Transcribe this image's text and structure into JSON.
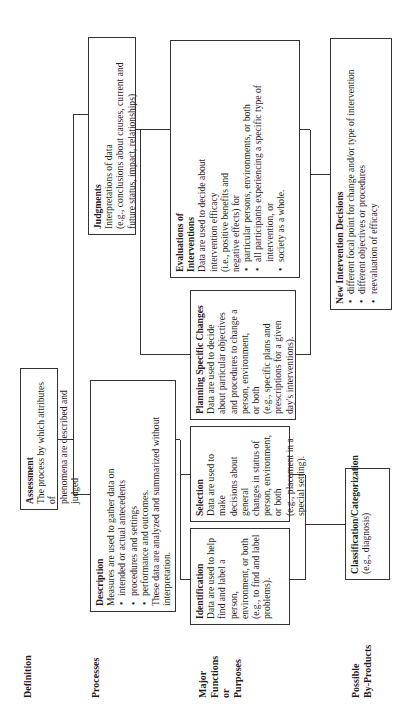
{
  "row_labels": {
    "definition": "Definition",
    "processes": "Processes",
    "functions": [
      "Major",
      "Functions",
      "or",
      "Purposes"
    ],
    "byproducts": [
      "Possible",
      "By-Products"
    ]
  },
  "assessment": {
    "title": "Assessment",
    "lines": [
      "The process by which attributes of",
      "phenomena are described and judged"
    ]
  },
  "description": {
    "title": "Description",
    "intro": "Measures are used to gather data on",
    "bullets": [
      "intended or actual antecedents",
      "procedures and settings",
      "performance and outcomes."
    ],
    "outro": "These data are analyzed and summarized without interpretation."
  },
  "judgments": {
    "title": "Judgments",
    "lines": [
      "Interpretations of data",
      "(e.g., conclusions about causes, current and",
      "future status, impact, relationships)"
    ]
  },
  "identification": {
    "title": "Identification",
    "lines": [
      "Data are used to help",
      "find and label a person,",
      "environment, or both",
      "(e.g., to find and label",
      "problems)."
    ]
  },
  "selection": {
    "title": "Selection",
    "lines": [
      "Data are used to make",
      "decisions about general",
      "changes in status of",
      "person, environment,",
      "or both",
      "(e.g., placement in a",
      "special setting)."
    ]
  },
  "planning": {
    "title": "Planning Specific Changes",
    "lines": [
      "Data are used to decide",
      "about particular objectives",
      "and procedures to change a",
      "person, environment,",
      "or both",
      "(e.g., specific plans and",
      "prescriptions for a given",
      "day's interventions)."
    ]
  },
  "evaluations": {
    "title": [
      "Evaluations of",
      "Interventions"
    ],
    "lines": [
      "Data are used to decide about",
      "intervention efficacy",
      "(i.e., positive benefits and",
      "negative effects) for"
    ],
    "bullets": [
      "particular persons, environments, or both",
      "all participants experiencing a specific type of intervention, or",
      "society as a whole."
    ]
  },
  "classification": {
    "title": "Classification/Categorization",
    "lines": [
      "(e.g., diagnosis)"
    ]
  },
  "new_intervention": {
    "title": "New Intervention Decisions",
    "bullets": [
      "different focal point for change and/or type of intervention",
      "different objectives or procedures",
      "reevaluation of efficacy"
    ]
  }
}
